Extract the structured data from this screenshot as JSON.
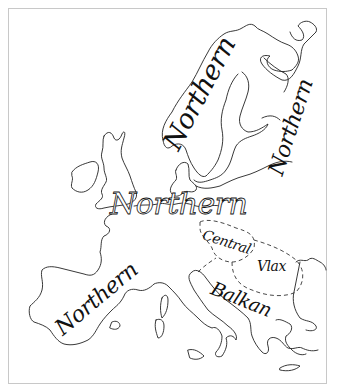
{
  "map": {
    "title": "",
    "region": "Europe",
    "labels": [
      {
        "id": "northern-scandinavia",
        "text": "Northern"
      },
      {
        "id": "northern-east",
        "text": "Northern"
      },
      {
        "id": "northern-central",
        "text": "Northern"
      },
      {
        "id": "northern-iberia",
        "text": "Northern"
      },
      {
        "id": "central",
        "text": "Central"
      },
      {
        "id": "vlax",
        "text": "Vlax"
      },
      {
        "id": "balkan",
        "text": "Balkan"
      }
    ],
    "colors": {
      "line": "#222222",
      "frame": "#c8c8c8",
      "background": "#ffffff"
    }
  }
}
